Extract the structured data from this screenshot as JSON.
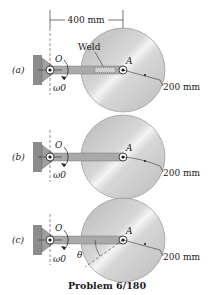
{
  "figure": {
    "caption": "Problem 6/180",
    "dimension_top": "400 mm",
    "weld_label": "Weld",
    "panels": [
      {
        "tag": "(a)",
        "pivot": "O",
        "center": "A",
        "omega": "ω0",
        "radius_label": "200 mm",
        "has_weld": true,
        "has_theta": false
      },
      {
        "tag": "(b)",
        "pivot": "O",
        "center": "A",
        "omega": "ω0",
        "radius_label": "200 mm",
        "has_weld": false,
        "has_theta": false
      },
      {
        "tag": "(c)",
        "pivot": "O",
        "center": "A",
        "omega": "ω0",
        "radius_label": "200 mm",
        "has_weld": false,
        "has_theta": true,
        "theta": "θ"
      }
    ]
  },
  "colors": {
    "disk": "#c8c8c8",
    "disk_highlight": "#ececec",
    "bar": "#a9a9a9",
    "wall": "#8c8c8c",
    "ink": "#1a1a1a"
  }
}
